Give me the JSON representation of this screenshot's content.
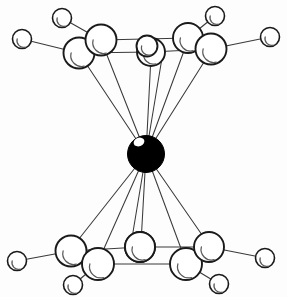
{
  "figure": {
    "background_color": "#fdfdfd",
    "bond_color": "#3a3a3a",
    "atom_fill_color": "#ffffff",
    "atom_outline_color": "#1a1a1a",
    "atom_shade_color": "#5a5a5a",
    "center_atom_color": "#000000"
  },
  "atoms": {
    "center": {
      "name": "central-metal-atom",
      "cx": 146,
      "cy": 154,
      "r": 18.5,
      "style": "filled-black",
      "highlight": {
        "cx": 139,
        "cy": 142,
        "rx": 5.5,
        "ry": 4.2
      }
    },
    "upper_ring": [
      {
        "name": "upper-atom-left-outer",
        "cx": 79,
        "cy": 53,
        "r": 15.5
      },
      {
        "name": "upper-atom-left-inner",
        "cx": 101,
        "cy": 40,
        "r": 15.5
      },
      {
        "name": "upper-atom-center-a",
        "cx": 151,
        "cy": 52,
        "r": 14.0
      },
      {
        "name": "upper-atom-center-b",
        "cx": 147,
        "cy": 46,
        "r": 10.5
      },
      {
        "name": "upper-atom-right-inner",
        "cx": 188,
        "cy": 38,
        "r": 15.0
      },
      {
        "name": "upper-atom-right-outer",
        "cx": 211,
        "cy": 49,
        "r": 15.5
      }
    ],
    "upper_peripheral": [
      {
        "name": "upper-peripheral-far-left",
        "cx": 22,
        "cy": 39,
        "r": 9.5
      },
      {
        "name": "upper-peripheral-top-left",
        "cx": 62,
        "cy": 18,
        "r": 9.5
      },
      {
        "name": "upper-peripheral-top-right",
        "cx": 215,
        "cy": 16,
        "r": 9.5
      },
      {
        "name": "upper-peripheral-far-right",
        "cx": 270,
        "cy": 37,
        "r": 9.5
      }
    ],
    "lower_ring": [
      {
        "name": "lower-atom-left-outer",
        "cx": 71,
        "cy": 251,
        "r": 15.5
      },
      {
        "name": "lower-atom-left-inner",
        "cx": 98,
        "cy": 264,
        "r": 16.0
      },
      {
        "name": "lower-atom-center",
        "cx": 140,
        "cy": 247,
        "r": 15.0
      },
      {
        "name": "lower-atom-right-inner",
        "cx": 186,
        "cy": 264,
        "r": 16.0
      },
      {
        "name": "lower-atom-right-outer",
        "cx": 209,
        "cy": 247,
        "r": 15.0
      },
      {
        "name": "lower-atom-center-back",
        "cx": 140,
        "cy": 247,
        "r": 15.0
      }
    ],
    "lower_peripheral": [
      {
        "name": "lower-peripheral-far-left",
        "cx": 17,
        "cy": 261,
        "r": 9.5
      },
      {
        "name": "lower-peripheral-bottom-left",
        "cx": 73,
        "cy": 285,
        "r": 9.5
      },
      {
        "name": "lower-peripheral-bottom-right",
        "cx": 219,
        "cy": 284,
        "r": 9.5
      },
      {
        "name": "lower-peripheral-far-right",
        "cx": 265,
        "cy": 258,
        "r": 9.5
      }
    ]
  },
  "bonds": {
    "center_to_upper": [
      {
        "name": "bond-center-upper-1",
        "x1": 146,
        "y1": 154,
        "x2": 79,
        "y2": 53
      },
      {
        "name": "bond-center-upper-2",
        "x1": 146,
        "y1": 154,
        "x2": 101,
        "y2": 40
      },
      {
        "name": "bond-center-upper-3",
        "x1": 146,
        "y1": 154,
        "x2": 151,
        "y2": 56
      },
      {
        "name": "bond-center-upper-4",
        "x1": 146,
        "y1": 154,
        "x2": 162,
        "y2": 58
      },
      {
        "name": "bond-center-upper-5",
        "x1": 146,
        "y1": 154,
        "x2": 188,
        "y2": 40
      },
      {
        "name": "bond-center-upper-6",
        "x1": 146,
        "y1": 154,
        "x2": 211,
        "y2": 51
      }
    ],
    "center_to_lower": [
      {
        "name": "bond-center-lower-1",
        "x1": 146,
        "y1": 154,
        "x2": 71,
        "y2": 249
      },
      {
        "name": "bond-center-lower-2",
        "x1": 146,
        "y1": 154,
        "x2": 98,
        "y2": 262
      },
      {
        "name": "bond-center-lower-3",
        "x1": 146,
        "y1": 154,
        "x2": 131,
        "y2": 244
      },
      {
        "name": "bond-center-lower-4",
        "x1": 146,
        "y1": 154,
        "x2": 141,
        "y2": 243
      },
      {
        "name": "bond-center-lower-5",
        "x1": 146,
        "y1": 154,
        "x2": 186,
        "y2": 262
      },
      {
        "name": "bond-center-lower-6",
        "x1": 146,
        "y1": 154,
        "x2": 209,
        "y2": 245
      }
    ],
    "upper_ring_bonds": [
      {
        "name": "bond-upper-ring-1",
        "x1": 79,
        "y1": 53,
        "x2": 101,
        "y2": 40
      },
      {
        "name": "bond-upper-ring-2",
        "x1": 101,
        "y1": 40,
        "x2": 188,
        "y2": 38
      },
      {
        "name": "bond-upper-ring-3",
        "x1": 79,
        "y1": 53,
        "x2": 151,
        "y2": 52
      },
      {
        "name": "bond-upper-ring-4",
        "x1": 151,
        "y1": 52,
        "x2": 211,
        "y2": 49
      },
      {
        "name": "bond-upper-ring-5",
        "x1": 188,
        "y1": 38,
        "x2": 211,
        "y2": 49
      }
    ],
    "lower_ring_bonds": [
      {
        "name": "bond-lower-ring-1",
        "x1": 71,
        "y1": 251,
        "x2": 98,
        "y2": 264
      },
      {
        "name": "bond-lower-ring-2",
        "x1": 98,
        "y1": 264,
        "x2": 186,
        "y2": 264
      },
      {
        "name": "bond-lower-ring-3",
        "x1": 71,
        "y1": 251,
        "x2": 140,
        "y2": 247
      },
      {
        "name": "bond-lower-ring-4",
        "x1": 140,
        "y1": 247,
        "x2": 209,
        "y2": 247
      },
      {
        "name": "bond-lower-ring-5",
        "x1": 186,
        "y1": 264,
        "x2": 209,
        "y2": 247
      }
    ],
    "peripheral_bonds": [
      {
        "name": "bond-peripheral-upper-far-left",
        "x1": 22,
        "y1": 39,
        "x2": 79,
        "y2": 53
      },
      {
        "name": "bond-peripheral-upper-top-left",
        "x1": 62,
        "y1": 18,
        "x2": 101,
        "y2": 40
      },
      {
        "name": "bond-peripheral-upper-top-right",
        "x1": 215,
        "y1": 16,
        "x2": 188,
        "y2": 38
      },
      {
        "name": "bond-peripheral-upper-far-right",
        "x1": 270,
        "y1": 37,
        "x2": 211,
        "y2": 49
      },
      {
        "name": "bond-peripheral-lower-far-left",
        "x1": 17,
        "y1": 261,
        "x2": 71,
        "y2": 251
      },
      {
        "name": "bond-peripheral-lower-bottom-left",
        "x1": 73,
        "y1": 285,
        "x2": 98,
        "y2": 264
      },
      {
        "name": "bond-peripheral-lower-bottom-right",
        "x1": 219,
        "y1": 284,
        "x2": 186,
        "y2": 264
      },
      {
        "name": "bond-peripheral-lower-far-right",
        "x1": 265,
        "y1": 258,
        "x2": 209,
        "y2": 247
      }
    ]
  }
}
